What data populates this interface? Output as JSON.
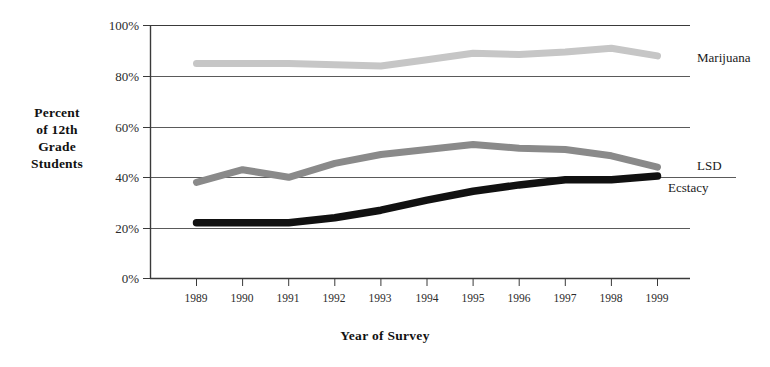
{
  "chart_data": {
    "type": "line",
    "title": "",
    "xlabel": "Year of Survey",
    "ylabel": "Percent of 12th Grade Students",
    "categories": [
      "1989",
      "1990",
      "1991",
      "1992",
      "1993",
      "1994",
      "1995",
      "1996",
      "1997",
      "1998",
      "1999"
    ],
    "x": [
      1989,
      1990,
      1991,
      1992,
      1993,
      1994,
      1995,
      1996,
      1997,
      1998,
      1999
    ],
    "xlim": [
      1989,
      1999
    ],
    "ylim": [
      0,
      100
    ],
    "ytick_labels": [
      "0%",
      "20%",
      "40%",
      "60%",
      "80%",
      "100%"
    ],
    "ytick_values": [
      0,
      20,
      40,
      60,
      80,
      100
    ],
    "grid": "horizontal",
    "legend": "right-inline-labels",
    "series": [
      {
        "name": "Marijuana",
        "color": "#c6c6c6",
        "values": [
          85,
          85,
          85,
          84.5,
          84,
          86.5,
          89,
          88.5,
          89.5,
          91,
          88
        ]
      },
      {
        "name": "LSD",
        "color": "#8a8a8a",
        "values": [
          38,
          43,
          40,
          45.5,
          49,
          51,
          53,
          51.5,
          51,
          48.5,
          44
        ]
      },
      {
        "name": "Ecstacy",
        "color": "#111111",
        "values": [
          22,
          22,
          22,
          24,
          27,
          31,
          34.5,
          37,
          39,
          39,
          40.5
        ]
      }
    ]
  },
  "ylabel_lines": [
    "Percent",
    "of 12th",
    "Grade",
    "Students"
  ],
  "axis": {
    "xlabel": "Year of Survey"
  },
  "labels": {
    "marijuana": "Marijuana",
    "lsd": "LSD",
    "ecstacy": "Ecstacy"
  }
}
